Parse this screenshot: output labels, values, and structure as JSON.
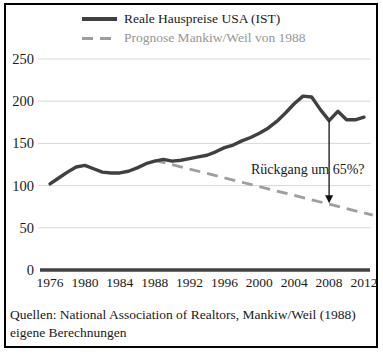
{
  "legend": {
    "series_actual": "Reale Hauspreise USA (IST)",
    "series_forecast": "Prognose Mankiw/Weil von 1988"
  },
  "chart_data": {
    "type": "line",
    "title": "",
    "xlabel": "",
    "ylabel": "",
    "xlim": [
      1976,
      2013
    ],
    "ylim": [
      0,
      250
    ],
    "yticks": [
      0,
      50,
      100,
      150,
      200,
      250
    ],
    "xticks": [
      1976,
      1980,
      1984,
      1988,
      1992,
      1996,
      2000,
      2004,
      2008,
      2012
    ],
    "grid": true,
    "legend_position": "top",
    "colors": {
      "actual_line": "#404040",
      "forecast_line": "#9e9e9e",
      "gridline": "#d9d9d9",
      "axis_zero_line": "#404040",
      "arrow": "#111111"
    },
    "series": [
      {
        "name": "Reale Hauspreise USA (IST)",
        "style": "solid",
        "color": "#404040",
        "x": [
          1976,
          1977,
          1978,
          1979,
          1980,
          1981,
          1982,
          1983,
          1984,
          1985,
          1986,
          1987,
          1988,
          1989,
          1990,
          1991,
          1992,
          1993,
          1994,
          1995,
          1996,
          1997,
          1998,
          1999,
          2000,
          2001,
          2002,
          2003,
          2004,
          2005,
          2006,
          2007,
          2008,
          2009,
          2010,
          2011,
          2012
        ],
        "values": [
          102,
          109,
          116,
          122,
          124,
          120,
          116,
          115,
          115,
          117,
          121,
          126,
          129,
          131,
          129,
          130,
          132,
          134,
          136,
          140,
          145,
          148,
          153,
          157,
          162,
          168,
          176,
          186,
          197,
          206,
          205,
          190,
          177,
          188,
          178,
          178,
          181
        ]
      },
      {
        "name": "Prognose Mankiw/Weil von 1988",
        "style": "dashed",
        "color": "#9e9e9e",
        "x": [
          1988,
          2013
        ],
        "values": [
          130,
          65
        ]
      }
    ],
    "annotation": {
      "text": "Rückgang um 65%?",
      "x_year": 2008,
      "from_value": 177,
      "to_value": 79
    }
  },
  "footer": {
    "sources_line1": "Quellen: National Association of Realtors, Mankiw/Weil (1988)",
    "sources_line2": "eigene Berechnungen"
  }
}
